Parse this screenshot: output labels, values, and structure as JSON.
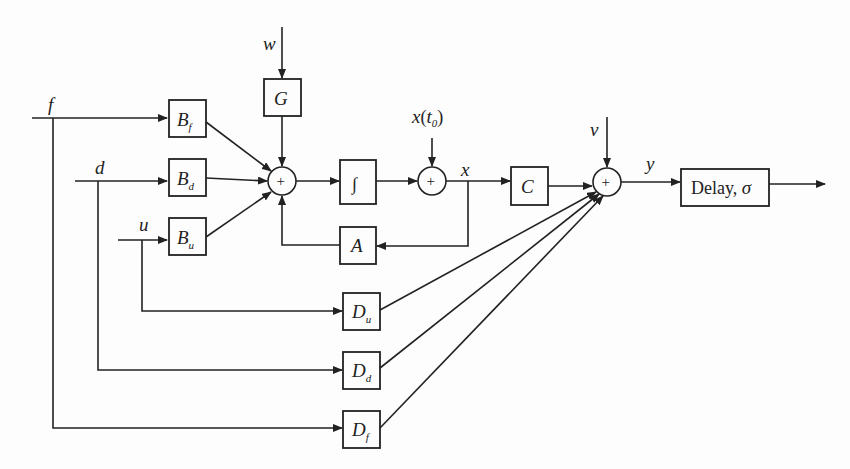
{
  "diagram": {
    "type": "block-diagram",
    "title": "",
    "signals": {
      "f": "f",
      "d": "d",
      "u": "u",
      "w": "w",
      "x0": "x",
      "x0_arg": "t",
      "x0_sub": "0",
      "x": "x",
      "v": "v",
      "y": "y"
    },
    "blocks": {
      "Bf": {
        "main": "B",
        "sub": "f"
      },
      "Bd": {
        "main": "B",
        "sub": "d"
      },
      "Bu": {
        "main": "B",
        "sub": "u"
      },
      "G": {
        "main": "G"
      },
      "integrator": {
        "main": "∫"
      },
      "A": {
        "main": "A"
      },
      "C": {
        "main": "C"
      },
      "Du": {
        "main": "D",
        "sub": "u"
      },
      "Dd": {
        "main": "D",
        "sub": "d"
      },
      "Df": {
        "main": "D",
        "sub": "f"
      },
      "delay": {
        "main": "Delay, ",
        "sigma": "σ"
      }
    },
    "sum_junctions": [
      {
        "id": "sum1",
        "symbol": "+",
        "inputs": [
          "Bf",
          "Bd",
          "Bu",
          "G",
          "A"
        ],
        "output": "integrator"
      },
      {
        "id": "sum2",
        "symbol": "+",
        "inputs": [
          "integrator",
          "x(t0)"
        ],
        "output": "x"
      },
      {
        "id": "sum3",
        "symbol": "+",
        "inputs": [
          "C",
          "v",
          "Du",
          "Dd",
          "Df"
        ],
        "output": "y"
      }
    ],
    "connections": [
      "f -> Bf",
      "f -> Df",
      "d -> Bd",
      "d -> Dd",
      "u -> Bu",
      "u -> Du",
      "w -> G",
      "Bf -> sum1",
      "Bd -> sum1",
      "Bu -> sum1",
      "G -> sum1",
      "A -> sum1",
      "sum1 -> integrator",
      "integrator -> sum2",
      "x(t0) -> sum2",
      "sum2 -> x",
      "x -> A",
      "x -> C",
      "C -> sum3",
      "v -> sum3",
      "Du -> sum3",
      "Dd -> sum3",
      "Df -> sum3",
      "sum3 -> y",
      "y -> delay",
      "delay -> output"
    ]
  }
}
